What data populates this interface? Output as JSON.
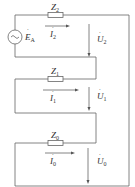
{
  "diagram": {
    "type": "circuit",
    "source": {
      "label": "E",
      "subscript": "A",
      "dot": true
    },
    "branches": [
      {
        "impedance": {
          "label": "Z",
          "subscript": "2"
        },
        "current": {
          "label": "I",
          "subscript": "2"
        },
        "voltage": {
          "label": "U",
          "subscript": "2"
        }
      },
      {
        "impedance": {
          "label": "Z",
          "subscript": "1"
        },
        "current": {
          "label": "I",
          "subscript": "1"
        },
        "voltage": {
          "label": "U",
          "subscript": "1"
        }
      },
      {
        "impedance": {
          "label": "Z",
          "subscript": "0"
        },
        "current": {
          "label": "I",
          "subscript": "0"
        },
        "voltage": {
          "label": "U",
          "subscript": "0"
        }
      }
    ],
    "colors": {
      "wire": "#666666",
      "text": "#333333",
      "background": "#ffffff"
    }
  }
}
